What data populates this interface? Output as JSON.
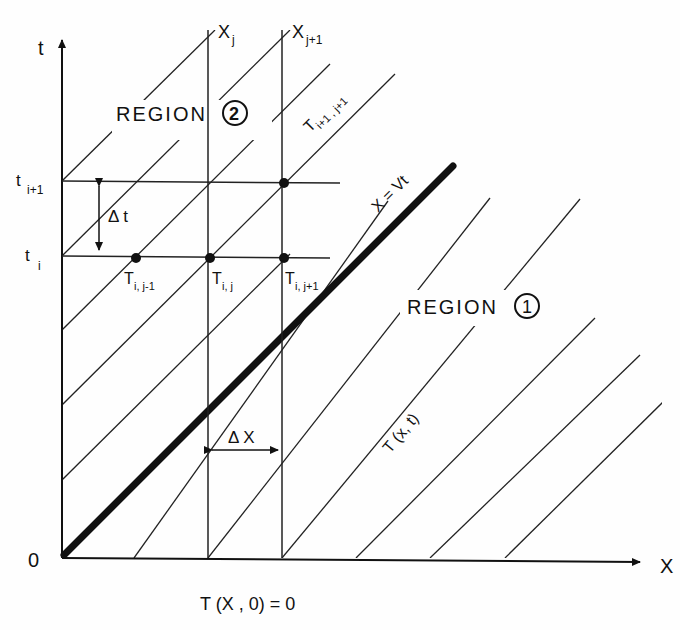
{
  "axes": {
    "t_label": "t",
    "x_label": "X",
    "origin_label": "0",
    "t_ticks": [
      {
        "label": "t",
        "sub": "i+1"
      },
      {
        "label": "t",
        "sub": "i"
      }
    ],
    "x_ticks": [
      {
        "label": "X",
        "sub": "j"
      },
      {
        "label": "X",
        "sub": "j+1"
      }
    ]
  },
  "regions": {
    "region2": {
      "text": "REGION",
      "num": "2"
    },
    "region1": {
      "text": "REGION",
      "num": "1"
    }
  },
  "annotations": {
    "boundary": "X = Vt",
    "characteristic_top": "T",
    "characteristic_top_sub": "i+1 , j+1",
    "characteristic_low": "T (x, t)",
    "delta_t": "Δ t",
    "delta_x": "Δ X",
    "initial_condition": "T (X , 0) = 0"
  },
  "nodes": [
    {
      "label": "T",
      "sub": "i, j-1"
    },
    {
      "label": "T",
      "sub": "i, j"
    },
    {
      "label": "T",
      "sub": "i, j+1"
    }
  ],
  "colors": {
    "ink": "#111111",
    "paper": "#fefefe"
  }
}
